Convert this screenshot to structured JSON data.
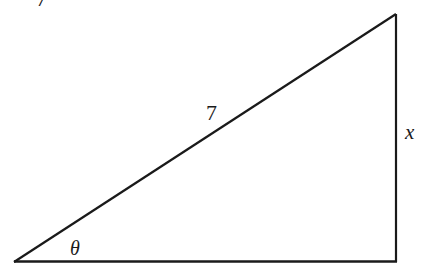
{
  "diagram": {
    "type": "right-triangle",
    "stroke_color": "#1a1a1a",
    "background": "#ffffff",
    "vertices": {
      "bottom_left": [
        14,
        262
      ],
      "bottom_right": [
        396,
        262
      ],
      "top_right": [
        396,
        14
      ]
    },
    "labels": {
      "hypotenuse": "7",
      "opposite_side": "x",
      "angle": "θ",
      "cropped_fragment": "7"
    }
  }
}
